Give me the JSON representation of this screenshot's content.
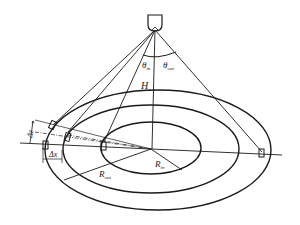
{
  "diagram": {
    "type": "geometric-schematic",
    "labels": {
      "theta_in": {
        "main": "θ",
        "sub": "in"
      },
      "theta_out": {
        "main": "θ",
        "sub": "out"
      },
      "height": {
        "main": "H",
        "sub": "c"
      },
      "delta_z": {
        "main": "Δz"
      },
      "delta_x": {
        "main": "Δx"
      },
      "r_in": {
        "main": "R",
        "sub": "in"
      },
      "r_out": {
        "main": "R",
        "sub": "out"
      }
    },
    "elements": [
      "camera",
      "outer-ellipse",
      "middle-ellipse",
      "inner-ellipse",
      "markers"
    ]
  }
}
